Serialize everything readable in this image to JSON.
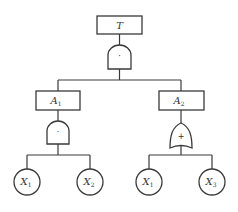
{
  "diagram": {
    "type": "fault-tree",
    "top_event": {
      "label": "T",
      "gate": {
        "type": "AND",
        "symbol": "·"
      }
    },
    "intermediate_events": [
      {
        "label": "A",
        "subscript": "1",
        "gate": {
          "type": "AND",
          "symbol": "·"
        }
      },
      {
        "label": "A",
        "subscript": "2",
        "gate": {
          "type": "OR",
          "symbol": "+"
        }
      }
    ],
    "basic_events": [
      {
        "label": "X",
        "subscript": "1",
        "parent": "A1"
      },
      {
        "label": "X",
        "subscript": "2",
        "parent": "A1"
      },
      {
        "label": "X",
        "subscript": "1",
        "parent": "A2"
      },
      {
        "label": "X",
        "subscript": "3",
        "parent": "A2"
      }
    ],
    "colors": {
      "line": "#3a3a3a",
      "background": "#ffffff"
    }
  }
}
